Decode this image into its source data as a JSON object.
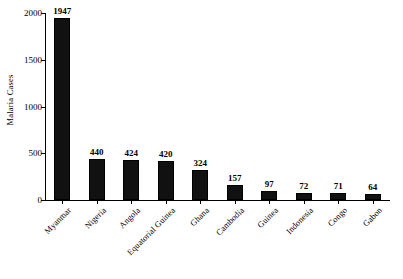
{
  "chart_data": {
    "type": "bar",
    "title": "",
    "xlabel": "",
    "ylabel": "Malaria Cases",
    "ylim": [
      0,
      2000
    ],
    "yticks": [
      0,
      500,
      1000,
      1500,
      2000
    ],
    "ytick_labels": [
      "0",
      "500",
      "1000",
      "1500",
      "2000"
    ],
    "grid": false,
    "legend": false,
    "bar_color": "#111111",
    "background_color": "#FFFFFF",
    "axis_color": "#000000",
    "categories": [
      "Myanmar",
      "Nigeria",
      "Angola",
      "Equatorial Guinea",
      "Ghana",
      "Cambodia",
      "Guinea",
      "Indonesia",
      "Congo",
      "Gabon"
    ],
    "values": [
      1947,
      440,
      424,
      420,
      324,
      157,
      97,
      72,
      71,
      64
    ],
    "value_labels": [
      "1947",
      "440",
      "424",
      "420",
      "324",
      "157",
      "97",
      "72",
      "71",
      "64"
    ]
  }
}
